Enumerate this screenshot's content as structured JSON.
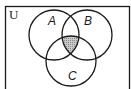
{
  "diagram": {
    "type": "venn",
    "universe_label": "U",
    "sets": [
      {
        "label": "A",
        "cx": 54,
        "cy": 35,
        "r": 25
      },
      {
        "label": "B",
        "cx": 87,
        "cy": 35,
        "r": 25
      },
      {
        "label": "C",
        "cx": 71,
        "cy": 61,
        "r": 25
      }
    ],
    "shaded_region": "A ∩ B ∩ C",
    "colors": {
      "stroke": "#1a1a1a",
      "shade": "#b8b8b8",
      "background": "#ffffff"
    }
  }
}
